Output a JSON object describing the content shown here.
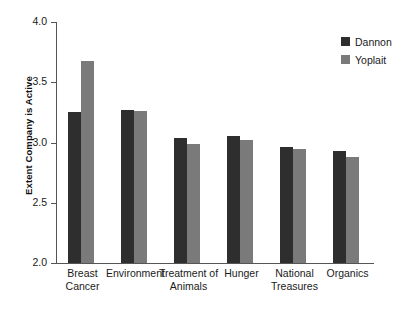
{
  "chart_data": {
    "type": "bar",
    "title": "",
    "subtitle": "",
    "xlabel": "",
    "ylabel": "Extent Company is Active",
    "ylim": [
      2.0,
      4.0
    ],
    "ytick_labels": [
      "4.0",
      "3.5",
      "3.0",
      "2.5",
      "2.0"
    ],
    "ytick_values": [
      4.0,
      3.5,
      3.0,
      2.5,
      2.0
    ],
    "grid": false,
    "legend_position": "top-right",
    "categories": [
      "Breast\nCancer",
      "Environment",
      "Treatment of\nAnimals",
      "Hunger",
      "National\nTreasures",
      "Organics"
    ],
    "series": [
      {
        "name": "Dannon",
        "color": "#2e2e2e",
        "values": [
          3.25,
          3.27,
          3.04,
          3.05,
          2.96,
          2.93
        ]
      },
      {
        "name": "Yoplait",
        "color": "#7a7a7a",
        "values": [
          3.68,
          3.26,
          2.99,
          3.02,
          2.95,
          2.88
        ]
      }
    ]
  },
  "legend": {
    "items": [
      {
        "label": "Dannon",
        "color": "#2e2e2e"
      },
      {
        "label": "Yoplait",
        "color": "#7a7a7a"
      }
    ]
  }
}
